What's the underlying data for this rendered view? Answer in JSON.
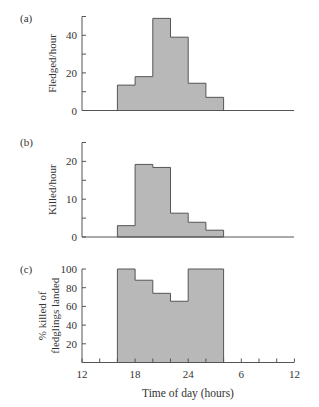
{
  "colors": {
    "bar_fill": "#b8b8b8",
    "bar_stroke": "#555555",
    "axis": "#555555",
    "text": "#333333"
  },
  "x_axis": {
    "label": "Time of day (hours)",
    "tick_labels": [
      "12",
      "18",
      "24",
      "6",
      "12"
    ],
    "tick_hours": [
      12,
      18,
      24,
      30,
      36
    ]
  },
  "chart_data": [
    {
      "panel": "(a)",
      "type": "bar",
      "ylabel": "Fledged/hour",
      "ylim": [
        0,
        50
      ],
      "yticks": [
        0,
        20,
        40
      ],
      "bin_edges_hours": [
        16,
        18,
        20,
        22,
        24,
        26,
        28
      ],
      "categories": [
        "16-18",
        "18-20",
        "20-22",
        "22-24",
        "0-2",
        "2-4"
      ],
      "values": [
        13.5,
        18,
        49,
        39,
        14.5,
        7
      ]
    },
    {
      "panel": "(b)",
      "type": "bar",
      "ylabel": "Killed/hour",
      "ylim": [
        0,
        25
      ],
      "yticks": [
        0,
        10,
        20
      ],
      "bin_edges_hours": [
        16,
        18,
        20,
        22,
        24,
        26,
        28
      ],
      "categories": [
        "16-18",
        "18-20",
        "20-22",
        "22-24",
        "0-2",
        "2-4"
      ],
      "values": [
        3,
        19.2,
        18.4,
        6.3,
        3.9,
        1.8
      ]
    },
    {
      "panel": "(c)",
      "type": "bar",
      "ylabel": "% killed of fledglings landed",
      "ylabel_lines": [
        "% killed of",
        "fledglings landed"
      ],
      "ylim": [
        0,
        100
      ],
      "yticks": [
        20,
        40,
        60,
        80,
        100
      ],
      "bin_edges_hours": [
        16,
        18,
        20,
        22,
        24,
        28
      ],
      "categories": [
        "16-18",
        "18-20",
        "20-22",
        "22-24",
        "0-4"
      ],
      "values": [
        100,
        88,
        74,
        65.5,
        100
      ],
      "xlabel": "Time of day (hours)",
      "xticks": [
        "12",
        "18",
        "24",
        "6",
        "12"
      ]
    }
  ]
}
